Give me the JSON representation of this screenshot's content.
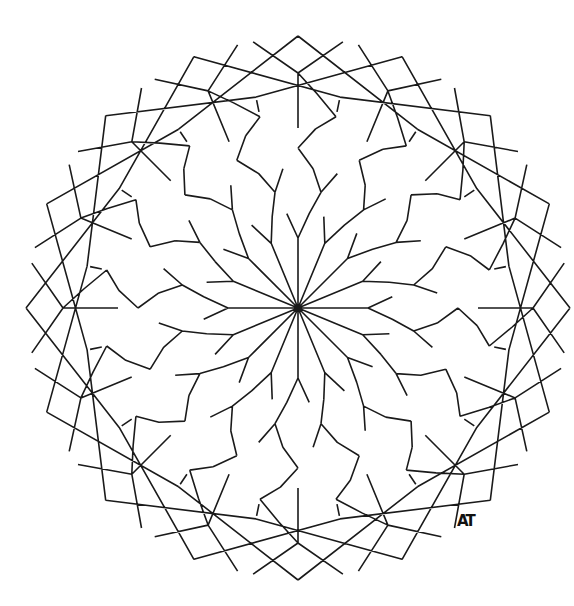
{
  "artwork": {
    "type": "geometric mandala line drawing",
    "symmetry": 16,
    "stroke_color": "#1a1a1a",
    "background": "#ffffff",
    "signature": "AT"
  }
}
